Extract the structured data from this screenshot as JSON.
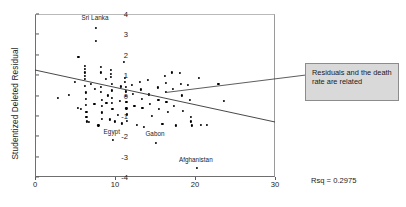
{
  "chart_data": {
    "type": "scatter",
    "title": "",
    "xlabel": "",
    "ylabel": "Studentized Deleted Residual",
    "xlim": [
      0,
      30
    ],
    "ylim": [
      -4,
      4
    ],
    "xticks": [
      0,
      10,
      20,
      30
    ],
    "yticks": [
      4,
      3,
      2,
      1,
      0,
      -1,
      -2,
      -3,
      -4
    ],
    "grid": false,
    "legend_position": "none",
    "rsq_label": "Rsq = 0.2975",
    "rsq_value": 0.2975,
    "fit_line": {
      "name": "linear fit",
      "x": [
        0,
        30
      ],
      "y": [
        1.25,
        -1.3
      ]
    },
    "annotations": [
      {
        "text": "Sri Lanka",
        "x": 7.5,
        "y": 3.8
      },
      {
        "text": "Egypt",
        "x": 9.6,
        "y": -1.78
      },
      {
        "text": "Gabon",
        "x": 15.0,
        "y": -1.88
      },
      {
        "text": "Afghanistan",
        "x": 20.1,
        "y": -3.18
      }
    ],
    "callout": {
      "text": "Residuals and the death rate are related",
      "leader_from": {
        "x": 16.4,
        "y": 0.15
      },
      "leader_to": {
        "x": 26.6,
        "y": 1.0
      }
    },
    "points": [
      {
        "x": 2.7,
        "y": -0.05
      },
      {
        "x": 4.1,
        "y": 0.08
      },
      {
        "x": 5.3,
        "y": 1.95
      },
      {
        "x": 4.9,
        "y": 0.72
      },
      {
        "x": 5.2,
        "y": -0.55
      },
      {
        "x": 5.6,
        "y": -0.62
      },
      {
        "x": 6.1,
        "y": 1.52
      },
      {
        "x": 6.1,
        "y": 1.35
      },
      {
        "x": 6.1,
        "y": 1.18
      },
      {
        "x": 6.1,
        "y": 1.02
      },
      {
        "x": 6.1,
        "y": 0.85
      },
      {
        "x": 6.15,
        "y": 0.52
      },
      {
        "x": 6.2,
        "y": 0.2
      },
      {
        "x": 6.2,
        "y": -0.1
      },
      {
        "x": 6.25,
        "y": -0.42
      },
      {
        "x": 6.3,
        "y": -0.75
      },
      {
        "x": 6.3,
        "y": -1.02
      },
      {
        "x": 6.35,
        "y": -1.22
      },
      {
        "x": 6.9,
        "y": 0.62
      },
      {
        "x": 6.6,
        "y": -1.25
      },
      {
        "x": 7.4,
        "y": 0.38
      },
      {
        "x": 7.3,
        "y": -0.38
      },
      {
        "x": 7.5,
        "y": 3.35
      },
      {
        "x": 7.5,
        "y": 2.72
      },
      {
        "x": 7.8,
        "y": -1.42
      },
      {
        "x": 8.1,
        "y": 1.45
      },
      {
        "x": 8.1,
        "y": 1.18
      },
      {
        "x": 8.1,
        "y": 0.48
      },
      {
        "x": 8.15,
        "y": 0.22
      },
      {
        "x": 8.2,
        "y": -0.18
      },
      {
        "x": 8.2,
        "y": -0.48
      },
      {
        "x": 8.2,
        "y": -0.78
      },
      {
        "x": 8.25,
        "y": -1.08
      },
      {
        "x": 8.7,
        "y": 0.88
      },
      {
        "x": 8.8,
        "y": -0.32
      },
      {
        "x": 9.0,
        "y": 0.05
      },
      {
        "x": 9.2,
        "y": -1.12
      },
      {
        "x": 9.4,
        "y": 1.3
      },
      {
        "x": 9.4,
        "y": 1.12
      },
      {
        "x": 9.4,
        "y": 0.95
      },
      {
        "x": 9.45,
        "y": 0.62
      },
      {
        "x": 9.5,
        "y": 0.3
      },
      {
        "x": 9.5,
        "y": -0.05
      },
      {
        "x": 9.5,
        "y": -0.3
      },
      {
        "x": 9.55,
        "y": -0.62
      },
      {
        "x": 9.6,
        "y": -2.12
      },
      {
        "x": 9.9,
        "y": -1.22
      },
      {
        "x": 10.2,
        "y": -0.9
      },
      {
        "x": 10.6,
        "y": 0.5
      },
      {
        "x": 10.5,
        "y": -0.22
      },
      {
        "x": 10.7,
        "y": -1.32
      },
      {
        "x": 11.0,
        "y": 1.68
      },
      {
        "x": 11.1,
        "y": 0.92
      },
      {
        "x": 11.1,
        "y": 0.72
      },
      {
        "x": 11.2,
        "y": 0.48
      },
      {
        "x": 11.2,
        "y": 0.25
      },
      {
        "x": 11.25,
        "y": 0.02
      },
      {
        "x": 11.3,
        "y": -0.28
      },
      {
        "x": 11.3,
        "y": -0.58
      },
      {
        "x": 11.35,
        "y": -0.88
      },
      {
        "x": 11.4,
        "y": -1.18
      },
      {
        "x": 12.0,
        "y": 0.55
      },
      {
        "x": 12.1,
        "y": 0.12
      },
      {
        "x": 12.3,
        "y": -0.48
      },
      {
        "x": 12.6,
        "y": -1.4
      },
      {
        "x": 13.0,
        "y": 0.7
      },
      {
        "x": 13.1,
        "y": 0.35
      },
      {
        "x": 13.2,
        "y": -0.12
      },
      {
        "x": 13.3,
        "y": -0.55
      },
      {
        "x": 13.5,
        "y": -1.48
      },
      {
        "x": 14.0,
        "y": 0.8
      },
      {
        "x": 14.1,
        "y": 0.1
      },
      {
        "x": 14.2,
        "y": -0.35
      },
      {
        "x": 14.5,
        "y": -0.95
      },
      {
        "x": 15.0,
        "y": -2.28
      },
      {
        "x": 15.2,
        "y": 0.45
      },
      {
        "x": 15.3,
        "y": -0.18
      },
      {
        "x": 15.4,
        "y": -0.62
      },
      {
        "x": 15.8,
        "y": -1.35
      },
      {
        "x": 16.1,
        "y": 1.0
      },
      {
        "x": 16.2,
        "y": 0.68
      },
      {
        "x": 16.2,
        "y": 0.22
      },
      {
        "x": 16.3,
        "y": -0.25
      },
      {
        "x": 16.5,
        "y": -0.75
      },
      {
        "x": 17.0,
        "y": 1.18
      },
      {
        "x": 17.1,
        "y": 0.38
      },
      {
        "x": 17.2,
        "y": -0.45
      },
      {
        "x": 17.5,
        "y": -1.42
      },
      {
        "x": 18.0,
        "y": 1.15
      },
      {
        "x": 18.1,
        "y": 0.6
      },
      {
        "x": 18.2,
        "y": 0.05
      },
      {
        "x": 18.4,
        "y": -0.72
      },
      {
        "x": 19.0,
        "y": 0.58
      },
      {
        "x": 19.2,
        "y": -0.15
      },
      {
        "x": 19.4,
        "y": -1.02
      },
      {
        "x": 19.4,
        "y": -1.22
      },
      {
        "x": 19.45,
        "y": -1.42
      },
      {
        "x": 20.1,
        "y": -3.52
      },
      {
        "x": 20.4,
        "y": 0.92
      },
      {
        "x": 20.6,
        "y": -1.38
      },
      {
        "x": 21.4,
        "y": -1.38
      },
      {
        "x": 22.8,
        "y": 0.62
      },
      {
        "x": 23.5,
        "y": -0.22
      }
    ]
  }
}
